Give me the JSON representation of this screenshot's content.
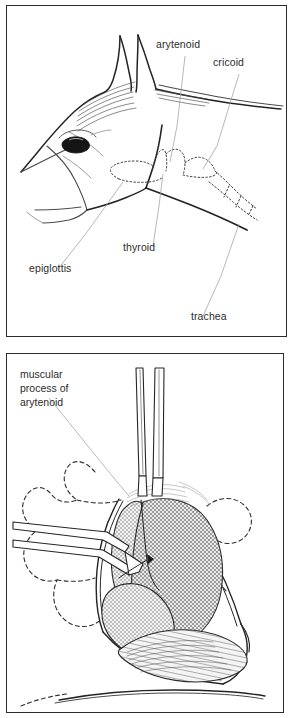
{
  "figure": {
    "background_color": "#ffffff",
    "panel_border_color": "#2b2b2b",
    "label_text_color": "#2d2d2d",
    "leader_line_color": "#9a9a9a",
    "ink_color": "#232323",
    "hatch_color": "#6f6f6f"
  },
  "panels": [
    {
      "id": "panel-top",
      "name": "lateral-head-surface-anatomy",
      "caption": "",
      "labels": [
        {
          "id": "arytenoid",
          "text": "arytenoid",
          "x": 155,
          "y": 44
        },
        {
          "id": "cricoid",
          "text": "cricoid",
          "x": 212,
          "y": 62
        },
        {
          "id": "thyroid",
          "text": "thyroid",
          "x": 122,
          "y": 249
        },
        {
          "id": "epiglottis",
          "text": "epiglottis",
          "x": 28,
          "y": 269
        },
        {
          "id": "trachea",
          "text": "trachea",
          "x": 190,
          "y": 317
        }
      ]
    },
    {
      "id": "panel-bottom",
      "name": "surgical-exposure-left-larynx",
      "caption": "",
      "labels": [
        {
          "id": "muscular-process-of-arytenoid",
          "lines": [
            "muscular",
            "process of",
            "arytenoid"
          ],
          "x": 13,
          "y": 377
        }
      ]
    }
  ]
}
